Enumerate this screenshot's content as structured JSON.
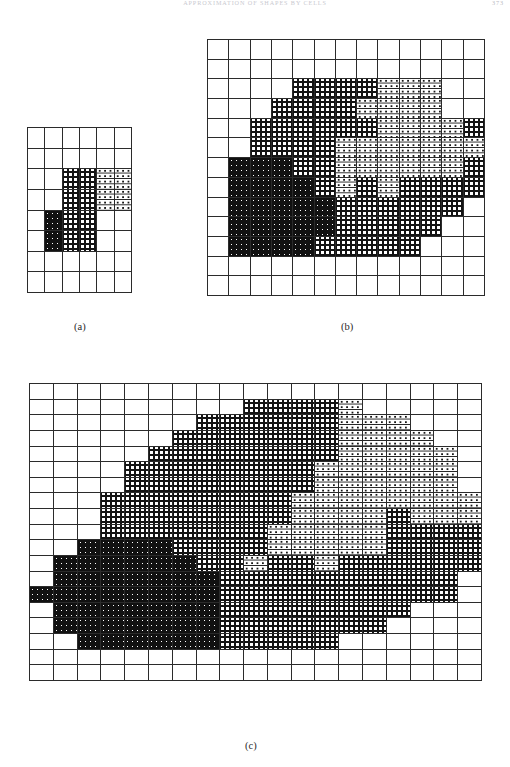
{
  "page": {
    "running_head": "APPROXIMATION OF SHAPES BY CELLS",
    "page_number": "373"
  },
  "figures": [
    {
      "id": "fig-a",
      "caption": "(a)",
      "cols": 6,
      "rows": 8,
      "legend": [
        "dark",
        "mid",
        "light"
      ],
      "cells": [
        [
          0,
          0,
          0,
          0,
          0,
          0
        ],
        [
          0,
          0,
          0,
          0,
          0,
          0
        ],
        [
          0,
          0,
          2,
          2,
          3,
          3
        ],
        [
          0,
          0,
          2,
          2,
          3,
          3
        ],
        [
          0,
          1,
          2,
          2,
          0,
          0
        ],
        [
          0,
          1,
          2,
          2,
          0,
          0
        ],
        [
          0,
          0,
          0,
          0,
          0,
          0
        ],
        [
          0,
          0,
          0,
          0,
          0,
          0
        ]
      ]
    },
    {
      "id": "fig-b",
      "caption": "(b)",
      "cols": 13,
      "rows": 13,
      "legend": [
        "dark",
        "mid",
        "light"
      ],
      "cells": [
        [
          0,
          0,
          0,
          0,
          0,
          0,
          0,
          0,
          0,
          0,
          0,
          0,
          0
        ],
        [
          0,
          0,
          0,
          0,
          0,
          0,
          0,
          0,
          0,
          0,
          0,
          0,
          0
        ],
        [
          0,
          0,
          0,
          0,
          2,
          2,
          2,
          2,
          3,
          3,
          3,
          0,
          0
        ],
        [
          0,
          0,
          0,
          2,
          2,
          2,
          2,
          3,
          3,
          3,
          3,
          0,
          0
        ],
        [
          0,
          0,
          2,
          2,
          2,
          2,
          2,
          2,
          3,
          3,
          3,
          3,
          2
        ],
        [
          0,
          0,
          2,
          2,
          2,
          2,
          3,
          3,
          3,
          3,
          3,
          3,
          3
        ],
        [
          0,
          1,
          1,
          1,
          2,
          2,
          3,
          3,
          3,
          3,
          3,
          3,
          2
        ],
        [
          0,
          1,
          1,
          1,
          1,
          2,
          3,
          2,
          3,
          2,
          2,
          2,
          2
        ],
        [
          0,
          1,
          1,
          1,
          1,
          1,
          2,
          2,
          2,
          2,
          2,
          2,
          0
        ],
        [
          0,
          1,
          1,
          1,
          1,
          1,
          2,
          2,
          2,
          2,
          2,
          0,
          0
        ],
        [
          0,
          1,
          1,
          1,
          1,
          2,
          2,
          2,
          2,
          2,
          0,
          0,
          0
        ],
        [
          0,
          0,
          0,
          0,
          0,
          0,
          0,
          0,
          0,
          0,
          0,
          0,
          0
        ],
        [
          0,
          0,
          0,
          0,
          0,
          0,
          0,
          0,
          0,
          0,
          0,
          0,
          0
        ]
      ]
    },
    {
      "id": "fig-c",
      "caption": "(c)",
      "cols": 19,
      "rows": 19,
      "legend": [
        "dark",
        "mid",
        "light"
      ],
      "cells": [
        [
          0,
          0,
          0,
          0,
          0,
          0,
          0,
          0,
          0,
          0,
          0,
          0,
          0,
          0,
          0,
          0,
          0,
          0,
          0
        ],
        [
          0,
          0,
          0,
          0,
          0,
          0,
          0,
          0,
          0,
          2,
          2,
          2,
          2,
          3,
          0,
          0,
          0,
          0,
          0
        ],
        [
          0,
          0,
          0,
          0,
          0,
          0,
          0,
          2,
          2,
          2,
          2,
          2,
          2,
          3,
          3,
          3,
          0,
          0,
          0
        ],
        [
          0,
          0,
          0,
          0,
          0,
          0,
          2,
          2,
          2,
          2,
          2,
          2,
          2,
          3,
          3,
          3,
          3,
          0,
          0
        ],
        [
          0,
          0,
          0,
          0,
          0,
          2,
          2,
          2,
          2,
          2,
          2,
          2,
          2,
          3,
          3,
          3,
          3,
          3,
          0
        ],
        [
          0,
          0,
          0,
          0,
          2,
          2,
          2,
          2,
          2,
          2,
          2,
          2,
          3,
          3,
          3,
          3,
          3,
          3,
          0
        ],
        [
          0,
          0,
          0,
          0,
          2,
          2,
          2,
          2,
          2,
          2,
          2,
          2,
          3,
          3,
          3,
          3,
          3,
          3,
          0
        ],
        [
          0,
          0,
          0,
          2,
          2,
          2,
          2,
          2,
          2,
          2,
          2,
          3,
          3,
          3,
          3,
          3,
          3,
          3,
          3
        ],
        [
          0,
          0,
          0,
          2,
          2,
          2,
          2,
          2,
          2,
          2,
          2,
          3,
          3,
          3,
          3,
          2,
          3,
          3,
          3
        ],
        [
          0,
          0,
          0,
          2,
          2,
          2,
          2,
          2,
          2,
          2,
          3,
          3,
          3,
          3,
          3,
          2,
          2,
          2,
          2
        ],
        [
          0,
          0,
          1,
          1,
          1,
          1,
          2,
          2,
          2,
          2,
          3,
          3,
          3,
          3,
          3,
          2,
          2,
          2,
          2
        ],
        [
          0,
          1,
          1,
          1,
          1,
          1,
          1,
          2,
          2,
          3,
          2,
          2,
          3,
          2,
          2,
          2,
          2,
          2,
          2
        ],
        [
          0,
          1,
          1,
          1,
          1,
          1,
          1,
          1,
          2,
          2,
          2,
          2,
          2,
          2,
          2,
          2,
          2,
          2,
          0
        ],
        [
          1,
          1,
          1,
          1,
          1,
          1,
          1,
          1,
          2,
          2,
          2,
          2,
          2,
          2,
          2,
          2,
          2,
          2,
          0
        ],
        [
          0,
          1,
          1,
          1,
          1,
          1,
          1,
          1,
          2,
          2,
          2,
          2,
          2,
          2,
          2,
          2,
          0,
          0,
          0
        ],
        [
          0,
          1,
          1,
          1,
          1,
          1,
          1,
          1,
          2,
          2,
          2,
          2,
          2,
          2,
          2,
          0,
          0,
          0,
          0
        ],
        [
          0,
          0,
          1,
          1,
          1,
          1,
          1,
          1,
          2,
          2,
          2,
          2,
          2,
          0,
          0,
          0,
          0,
          0,
          0
        ],
        [
          0,
          0,
          0,
          0,
          0,
          0,
          0,
          0,
          0,
          0,
          0,
          0,
          0,
          0,
          0,
          0,
          0,
          0,
          0
        ],
        [
          0,
          0,
          0,
          0,
          0,
          0,
          0,
          0,
          0,
          0,
          0,
          0,
          0,
          0,
          0,
          0,
          0,
          0,
          0
        ]
      ]
    }
  ]
}
